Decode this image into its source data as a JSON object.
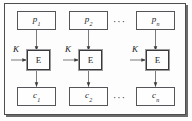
{
  "figure": {
    "frame_color": "#4d4d4d",
    "line_color": "#6a6a6e",
    "text_color": "#1d1d1f",
    "background": "#fdfdfd"
  },
  "columns": [
    {
      "id": "col-1",
      "plaintext": {
        "base": "p",
        "sub": "1"
      },
      "cipher_engine": "E",
      "key": "K",
      "ciphertext": {
        "base": "c",
        "sub": "1"
      }
    },
    {
      "id": "col-2",
      "plaintext": {
        "base": "p",
        "sub": "2"
      },
      "cipher_engine": "E",
      "key": "K",
      "ciphertext": {
        "base": "c",
        "sub": "2"
      }
    },
    {
      "id": "col-n",
      "plaintext": {
        "base": "p",
        "sub": "n"
      },
      "cipher_engine": "E",
      "key": "K",
      "ciphertext": {
        "base": "c",
        "sub": "n"
      }
    }
  ],
  "ellipses": {
    "top": "···",
    "bottom": "···"
  }
}
